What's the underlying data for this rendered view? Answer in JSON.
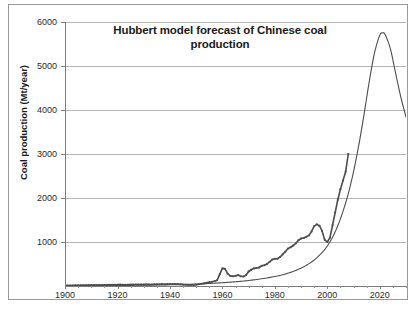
{
  "chart_data": {
    "type": "line",
    "title": "Hubbert model forecast of Chinese coal production",
    "xlabel": "",
    "ylabel": "Coal production (Mt/year)",
    "xlim": [
      1900,
      2030
    ],
    "ylim": [
      0,
      6000
    ],
    "x_ticks": [
      1900,
      1920,
      1940,
      1960,
      1980,
      2000,
      2020
    ],
    "y_ticks": [
      0,
      1000,
      2000,
      3000,
      4000,
      5000,
      6000
    ],
    "grid": "horizontal",
    "legend": "none",
    "series": [
      {
        "name": "Historical production data",
        "style": "line-with-markers",
        "color": "#4d4d4d",
        "x": [
          1900,
          1901,
          1902,
          1903,
          1904,
          1905,
          1906,
          1907,
          1908,
          1909,
          1910,
          1911,
          1912,
          1913,
          1914,
          1915,
          1916,
          1917,
          1918,
          1919,
          1920,
          1921,
          1922,
          1923,
          1924,
          1925,
          1926,
          1927,
          1928,
          1929,
          1930,
          1931,
          1932,
          1933,
          1934,
          1935,
          1936,
          1937,
          1938,
          1939,
          1940,
          1941,
          1942,
          1943,
          1944,
          1945,
          1946,
          1947,
          1948,
          1949,
          1950,
          1951,
          1952,
          1953,
          1954,
          1955,
          1956,
          1957,
          1958,
          1959,
          1960,
          1961,
          1962,
          1963,
          1964,
          1965,
          1966,
          1967,
          1968,
          1969,
          1970,
          1971,
          1972,
          1973,
          1974,
          1975,
          1976,
          1977,
          1978,
          1979,
          1980,
          1981,
          1982,
          1983,
          1984,
          1985,
          1986,
          1987,
          1988,
          1989,
          1990,
          1991,
          1992,
          1993,
          1994,
          1995,
          1996,
          1997,
          1998,
          1999,
          2000,
          2001,
          2002,
          2003,
          2004,
          2005,
          2006,
          2007,
          2008
        ],
        "y": [
          10,
          11,
          12,
          13,
          14,
          15,
          16,
          17,
          18,
          19,
          20,
          21,
          22,
          23,
          22,
          23,
          25,
          27,
          28,
          29,
          30,
          31,
          30,
          29,
          30,
          31,
          32,
          33,
          33,
          34,
          35,
          36,
          35,
          34,
          36,
          38,
          40,
          42,
          40,
          42,
          45,
          44,
          43,
          42,
          38,
          32,
          28,
          26,
          25,
          24,
          30,
          40,
          50,
          60,
          75,
          85,
          95,
          110,
          130,
          270,
          400,
          390,
          280,
          230,
          220,
          230,
          250,
          220,
          215,
          245,
          330,
          370,
          400,
          410,
          420,
          460,
          470,
          500,
          550,
          600,
          620,
          620,
          660,
          720,
          780,
          850,
          880,
          920,
          970,
          1040,
          1080,
          1090,
          1120,
          1150,
          1240,
          1360,
          1400,
          1370,
          1250,
          1050,
          1000,
          1100,
          1380,
          1670,
          1960,
          2200,
          2400,
          2600,
          3000
        ]
      },
      {
        "name": "Hubbert model forecast curve",
        "style": "smooth-line",
        "color": "#4d4d4d",
        "peak_year": 2021,
        "peak_value": 5750,
        "end_year": 2030,
        "end_value": 3840,
        "x": [
          1900,
          1910,
          1920,
          1930,
          1940,
          1950,
          1955,
          1960,
          1965,
          1970,
          1975,
          1980,
          1983,
          1986,
          1989,
          1992,
          1995,
          1998,
          2000,
          2002,
          2004,
          2006,
          2008,
          2010,
          2012,
          2014,
          2016,
          2018,
          2020,
          2021,
          2022,
          2024,
          2026,
          2028,
          2030
        ],
        "y": [
          5,
          8,
          12,
          18,
          28,
          45,
          58,
          75,
          96,
          125,
          165,
          215,
          255,
          310,
          380,
          470,
          590,
          760,
          910,
          1110,
          1370,
          1700,
          2100,
          2600,
          3200,
          3900,
          4650,
          5300,
          5700,
          5750,
          5720,
          5400,
          4850,
          4300,
          3840
        ]
      }
    ]
  },
  "axes": {
    "y_tick_labels": [
      "6000",
      "5000",
      "4000",
      "3000",
      "2000",
      "1000"
    ],
    "x_tick_labels": [
      "1900",
      "1920",
      "1940",
      "1960",
      "1980",
      "2000",
      "2020"
    ]
  }
}
